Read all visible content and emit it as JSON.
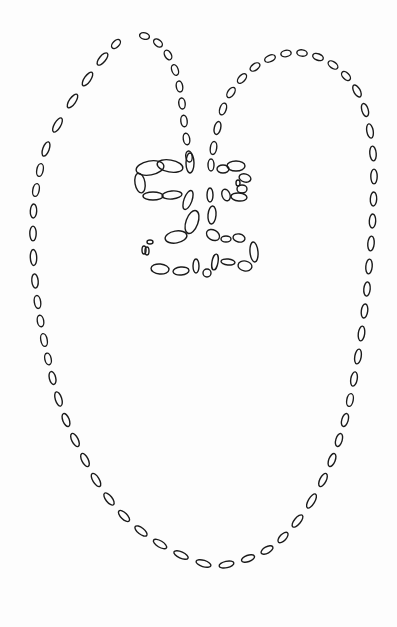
{
  "canvas": {
    "width": 397,
    "height": 627,
    "background": "#fdfdfd",
    "stroke": "#1a1a1a"
  },
  "drawing": {
    "description": "Hand-drawn outline figure made of hollow dash beads: a large heart/leaf-shaped outer loop with two lobes meeting at a central stem, and a small ladder-like motif of two looped rungs at the center.",
    "paths": [
      {
        "name": "left-lobe-outer",
        "points": [
          [
            122,
            38
          ],
          [
            110,
            50
          ],
          [
            95,
            68
          ],
          [
            80,
            90
          ],
          [
            65,
            112
          ],
          [
            50,
            138
          ],
          [
            42,
            160
          ],
          [
            38,
            180
          ],
          [
            34,
            200
          ],
          [
            33,
            222
          ],
          [
            33,
            245
          ],
          [
            34,
            270
          ],
          [
            36,
            292
          ],
          [
            39,
            312
          ],
          [
            42,
            330
          ],
          [
            46,
            350
          ],
          [
            50,
            368
          ],
          [
            55,
            388
          ],
          [
            62,
            410
          ],
          [
            70,
            430
          ],
          [
            80,
            450
          ],
          [
            90,
            470
          ],
          [
            102,
            490
          ],
          [
            116,
            508
          ],
          [
            132,
            524
          ],
          [
            150,
            538
          ],
          [
            170,
            550
          ],
          [
            192,
            560
          ],
          [
            215,
            567
          ]
        ]
      },
      {
        "name": "right-lobe-outer",
        "points": [
          [
            215,
            567
          ],
          [
            238,
            562
          ],
          [
            258,
            555
          ],
          [
            276,
            545
          ],
          [
            290,
            530
          ],
          [
            305,
            512
          ],
          [
            318,
            490
          ],
          [
            328,
            470
          ],
          [
            336,
            450
          ],
          [
            342,
            430
          ],
          [
            348,
            410
          ],
          [
            352,
            390
          ],
          [
            356,
            368
          ],
          [
            360,
            345
          ],
          [
            363,
            322
          ],
          [
            366,
            300
          ],
          [
            368,
            278
          ],
          [
            370,
            255
          ],
          [
            372,
            232
          ],
          [
            373,
            210
          ],
          [
            374,
            188
          ],
          [
            374,
            165
          ],
          [
            372,
            142
          ],
          [
            368,
            120
          ],
          [
            362,
            100
          ],
          [
            352,
            82
          ],
          [
            340,
            70
          ],
          [
            326,
            60
          ],
          [
            310,
            54
          ],
          [
            294,
            52
          ],
          [
            278,
            55
          ],
          [
            262,
            62
          ],
          [
            248,
            72
          ],
          [
            236,
            85
          ],
          [
            226,
            100
          ],
          [
            220,
            118
          ],
          [
            215,
            138
          ],
          [
            212,
            158
          ]
        ]
      },
      {
        "name": "left-lobe-inner",
        "points": [
          [
            137,
            34
          ],
          [
            152,
            38
          ],
          [
            164,
            48
          ],
          [
            172,
            62
          ],
          [
            178,
            78
          ],
          [
            181,
            95
          ],
          [
            183,
            112
          ],
          [
            185,
            130
          ],
          [
            188,
            148
          ],
          [
            190,
            165
          ]
        ]
      }
    ],
    "center_motif": {
      "name": "ladder-rungs",
      "beads": [
        [
          150,
          168,
          14,
          7,
          -10
        ],
        [
          170,
          166,
          13,
          6,
          10
        ],
        [
          190,
          163,
          4,
          10,
          0
        ],
        [
          211,
          165,
          3,
          6,
          0
        ],
        [
          223,
          169,
          6,
          4,
          0
        ],
        [
          236,
          166,
          9,
          5,
          0
        ],
        [
          245,
          178,
          6,
          4,
          15
        ],
        [
          242,
          189,
          5,
          4,
          0
        ],
        [
          238,
          183,
          2,
          3,
          0
        ],
        [
          140,
          183,
          5,
          10,
          -10
        ],
        [
          153,
          196,
          10,
          4,
          0
        ],
        [
          172,
          195,
          10,
          4,
          -5
        ],
        [
          188,
          200,
          4,
          10,
          20
        ],
        [
          210,
          195,
          3,
          7,
          0
        ],
        [
          226,
          195,
          4,
          6,
          -20
        ],
        [
          239,
          197,
          8,
          4,
          5
        ],
        [
          192,
          222,
          6,
          12,
          20
        ],
        [
          212,
          215,
          4,
          9,
          5
        ],
        [
          176,
          237,
          11,
          6,
          -10
        ],
        [
          150,
          242,
          3,
          2,
          0
        ],
        [
          144,
          250,
          2,
          4,
          0
        ],
        [
          147,
          251,
          2,
          4,
          0
        ],
        [
          213,
          235,
          7,
          5,
          30
        ],
        [
          226,
          239,
          5,
          3,
          0
        ],
        [
          239,
          238,
          6,
          4,
          10
        ],
        [
          254,
          252,
          4,
          10,
          -5
        ],
        [
          160,
          269,
          9,
          5,
          5
        ],
        [
          181,
          271,
          8,
          4,
          -5
        ],
        [
          196,
          266,
          3,
          7,
          0
        ],
        [
          207,
          273,
          4,
          4,
          0
        ],
        [
          215,
          262,
          3,
          8,
          10
        ],
        [
          228,
          262,
          7,
          3,
          5
        ],
        [
          245,
          266,
          7,
          5,
          10
        ]
      ]
    }
  }
}
